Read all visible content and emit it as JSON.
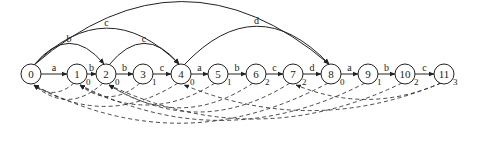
{
  "diagram": {
    "type": "automaton",
    "node_radius": 10,
    "node_y": 74,
    "nodes": [
      {
        "id": "0",
        "x": 31,
        "sub": ""
      },
      {
        "id": "1",
        "x": 77,
        "sub": "0"
      },
      {
        "id": "2",
        "x": 106,
        "sub": "0"
      },
      {
        "id": "3",
        "x": 143,
        "sub": "1"
      },
      {
        "id": "4",
        "x": 181,
        "sub": "0"
      },
      {
        "id": "5",
        "x": 218,
        "sub": "1"
      },
      {
        "id": "6",
        "x": 256,
        "sub": "2"
      },
      {
        "id": "7",
        "x": 293,
        "sub": "2"
      },
      {
        "id": "8",
        "x": 331,
        "sub": "0"
      },
      {
        "id": "9",
        "x": 368,
        "sub": "1"
      },
      {
        "id": "10",
        "x": 405,
        "sub": "2"
      },
      {
        "id": "11",
        "x": 444,
        "sub": "3"
      }
    ],
    "chain_edges": [
      {
        "from": "0",
        "to": "1",
        "label": "a"
      },
      {
        "from": "1",
        "to": "2",
        "label": "b"
      },
      {
        "from": "2",
        "to": "3",
        "label": "b"
      },
      {
        "from": "3",
        "to": "4",
        "label": "c"
      },
      {
        "from": "4",
        "to": "5",
        "label": "a"
      },
      {
        "from": "5",
        "to": "6",
        "label": "b"
      },
      {
        "from": "6",
        "to": "7",
        "label": "c"
      },
      {
        "from": "7",
        "to": "8",
        "label": "d"
      },
      {
        "from": "8",
        "to": "9",
        "label": "a"
      },
      {
        "from": "9",
        "to": "10",
        "label": "b"
      },
      {
        "from": "10",
        "to": "11",
        "label": "c"
      }
    ],
    "arc_edges": [
      {
        "from": "0",
        "to": "2",
        "label": "b",
        "height": 22
      },
      {
        "from": "0",
        "to": "4",
        "label": "c",
        "height": 38
      },
      {
        "from": "0",
        "to": "8",
        "label": "d",
        "height": 66
      },
      {
        "from": "2",
        "to": "4",
        "label": "c",
        "height": 22
      },
      {
        "from": "4",
        "to": "8",
        "label": "d",
        "height": 40
      }
    ],
    "failure_edges": [
      {
        "from": "1",
        "to": "0",
        "depth": 12
      },
      {
        "from": "2",
        "to": "0",
        "depth": 22
      },
      {
        "from": "3",
        "to": "1",
        "depth": 18
      },
      {
        "from": "4",
        "to": "0",
        "depth": 32
      },
      {
        "from": "5",
        "to": "1",
        "depth": 30
      },
      {
        "from": "6",
        "to": "2",
        "depth": 34
      },
      {
        "from": "7",
        "to": "2",
        "depth": 40
      },
      {
        "from": "8",
        "to": "0",
        "depth": 56
      },
      {
        "from": "9",
        "to": "1",
        "depth": 52
      },
      {
        "from": "10",
        "to": "2",
        "depth": 50
      },
      {
        "from": "11",
        "to": "4",
        "depth": 38
      },
      {
        "from": "11",
        "to": "7",
        "depth": 22
      }
    ]
  }
}
